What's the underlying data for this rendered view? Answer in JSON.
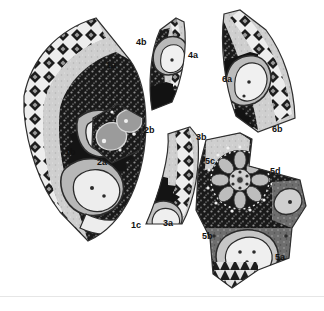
{
  "figure": {
    "caption_partial": "potsherds of the diagram",
    "background_color": "#ffffff",
    "rule_color": "#e6e6e6",
    "label_color": "#111111",
    "width": 324,
    "height": 311
  },
  "palette": {
    "sherd_dark": "#1b1b1b",
    "sherd_mid": "#6f6f6f",
    "sherd_light": "#c9c9c9",
    "sherd_pale": "#e2e2e2",
    "outline": "#3a3a3a",
    "white": "#f7f7f7"
  },
  "sherds": [
    {
      "id": "sherd-1",
      "shape": "crescent-arc",
      "labels": [
        {
          "name": "label-1a",
          "text": "1a",
          "x": 106,
          "y": 61
        },
        {
          "name": "label-1b",
          "text": "1b",
          "x": 65,
          "y": 148
        },
        {
          "name": "label-1c",
          "text": "1c",
          "x": 131,
          "y": 221
        }
      ]
    },
    {
      "id": "sherd-2",
      "shape": "pentagonal-fragment",
      "labels": [
        {
          "name": "label-2a",
          "text": "2a",
          "x": 97,
          "y": 158
        },
        {
          "name": "label-2b",
          "text": "2b",
          "x": 144,
          "y": 126
        }
      ]
    },
    {
      "id": "sherd-3",
      "shape": "wedge-fragment",
      "labels": [
        {
          "name": "label-3a",
          "text": "3a",
          "x": 163,
          "y": 219
        },
        {
          "name": "label-3b",
          "text": "3b",
          "x": 196,
          "y": 133
        }
      ]
    },
    {
      "id": "sherd-4",
      "shape": "tapered-wedge",
      "labels": [
        {
          "name": "label-4a",
          "text": "4a",
          "x": 188,
          "y": 51
        },
        {
          "name": "label-4b",
          "text": "4b",
          "x": 136,
          "y": 38
        }
      ]
    },
    {
      "id": "sherd-5",
      "shape": "large-central-fragment-with-rosette",
      "labels": [
        {
          "name": "label-5a",
          "text": "5a",
          "x": 275,
          "y": 253
        },
        {
          "name": "label-5b",
          "text": "5b",
          "x": 202,
          "y": 232
        },
        {
          "name": "label-5c",
          "text": "5c",
          "x": 205,
          "y": 157
        },
        {
          "name": "label-5d",
          "text": "5d",
          "x": 270,
          "y": 167
        }
      ]
    },
    {
      "id": "sherd-6",
      "shape": "curved-rim-fragment",
      "labels": [
        {
          "name": "label-6a",
          "text": "6a",
          "x": 222,
          "y": 75
        },
        {
          "name": "label-6b",
          "text": "6b",
          "x": 272,
          "y": 125
        }
      ]
    }
  ]
}
